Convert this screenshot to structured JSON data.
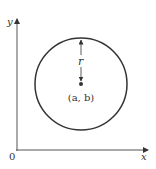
{
  "diagram": {
    "axes": {
      "x_label": "x",
      "y_label": "y",
      "origin_label": "0"
    },
    "circle": {
      "center_label": "(a, b)",
      "radius_label": "r"
    },
    "colors": {
      "stroke": "#333333",
      "background": "#ffffff"
    }
  }
}
